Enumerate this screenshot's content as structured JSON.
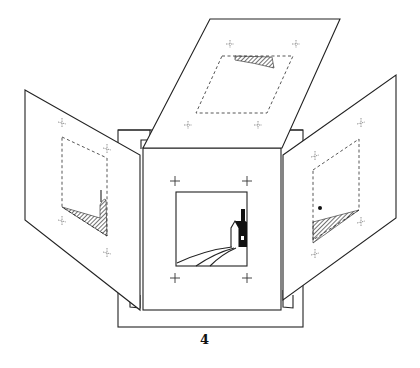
{
  "figure": {
    "label": "4",
    "colors": {
      "ink": "#222222",
      "background": "#ffffff"
    },
    "parts": {
      "back_board": "base board behind all panels",
      "center_panel": "front panel with square window showing house",
      "left_flap": "flap folded open to the left with dashed frame and hatched hill",
      "top_flap": "flap folded up with dashed frame and hatched strip",
      "right_flap": "flap folded open to the right with dashed frame, dot and hatched triangle"
    }
  }
}
